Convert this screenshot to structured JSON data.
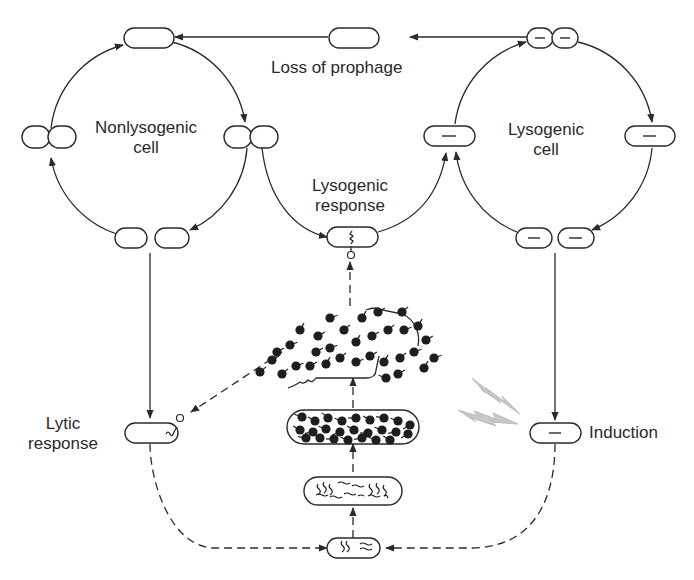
{
  "diagram": {
    "cycles": {
      "left": {
        "label": "Nonlysogenic\ncell",
        "label_line1": "Nonlysogenic",
        "label_line2": "cell"
      },
      "right": {
        "label": "Lysogenic\ncell",
        "label_line1": "Lysogenic",
        "label_line2": "cell"
      }
    },
    "labels": {
      "loss_of_prophage": "Loss of prophage",
      "lysogenic_response_1": "Lysogenic",
      "lysogenic_response_2": "response",
      "lytic_response_1": "Lytic",
      "lytic_response_2": "response",
      "induction": "Induction"
    },
    "nodes": [
      "nonlysogenic cell (top)",
      "nonlysogenic dividing cell (right)",
      "nonlysogenic daughter cells (bottom)",
      "nonlysogenic dividing cell (left)",
      "lysogenic dividing cell (top, prophage)",
      "lysogenic cell (right, prophage)",
      "lysogenic daughter cells (bottom, prophage)",
      "lysogenic cell (left, prophage)",
      "phage-infected cell (lysogenic response)",
      "phage-infected cell (lytic response)",
      "induced lysogen",
      "cell with replicating phage DNA",
      "cell with phage DNA copies",
      "cell full of phage particles",
      "lysed cell releasing phages"
    ],
    "edges": [
      {
        "from": "lysogenic dividing cell (top)",
        "to": "nonlysogenic cell (top)",
        "style": "solid",
        "label": "Loss of prophage"
      },
      {
        "from": "nonlysogenic dividing cell (right)",
        "to": "phage-infected cell (lysogenic response)",
        "style": "solid"
      },
      {
        "from": "phage-infected cell (lysogenic response)",
        "to": "lysogenic cell (left)",
        "style": "solid"
      },
      {
        "from": "nonlysogenic daughter cells",
        "to": "phage-infected cell (lytic response)",
        "style": "solid"
      },
      {
        "from": "lysogenic daughter cells",
        "to": "induced lysogen",
        "style": "solid"
      },
      {
        "from": "phage-infected cell (lytic response)",
        "to": "cell with replicating phage DNA",
        "style": "dashed"
      },
      {
        "from": "induced lysogen",
        "to": "cell with replicating phage DNA",
        "style": "dashed"
      },
      {
        "from": "cell with replicating phage DNA",
        "to": "cell with phage DNA copies",
        "style": "dashed"
      },
      {
        "from": "cell with phage DNA copies",
        "to": "cell full of phage particles",
        "style": "dashed"
      },
      {
        "from": "cell full of phage particles",
        "to": "lysed cell releasing phages",
        "style": "dashed"
      },
      {
        "from": "lysed cell releasing phages",
        "to": "phage-infected cell (lytic response)",
        "style": "dashed"
      },
      {
        "from": "lysed cell releasing phages",
        "to": "phage-infected cell (lysogenic response)",
        "style": "dashed"
      }
    ],
    "colors": {
      "ink": "#2a2a2a",
      "lightning": "#c8c8c8",
      "background": "#ffffff"
    }
  }
}
